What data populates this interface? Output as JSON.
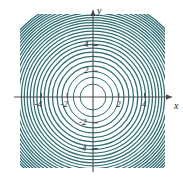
{
  "figure": {
    "name": "concentric-circle-contour-plot",
    "background_color": "#ffffff",
    "contour_color": "#2e6e73",
    "axis_color": "#4a4a4a"
  },
  "axes": {
    "x_label": "x",
    "y_label": "y",
    "x_ticks": [
      {
        "value": -4,
        "label": "-4"
      },
      {
        "value": -2,
        "label": "-2"
      },
      {
        "value": 2,
        "label": "2"
      },
      {
        "value": 4,
        "label": "4"
      }
    ],
    "y_ticks": [
      {
        "value": 4,
        "label": "4"
      },
      {
        "value": 2,
        "label": "2"
      },
      {
        "value": -2,
        "label": "-2"
      },
      {
        "value": -4,
        "label": "-4"
      }
    ]
  },
  "chart_data": {
    "type": "line",
    "title": "",
    "subtitle": "",
    "xlabel": "x",
    "ylabel": "y",
    "xlim": [
      -5.6,
      5.6
    ],
    "ylim": [
      -5.6,
      5.6
    ],
    "grid": false,
    "legend": null,
    "center": [
      0,
      0
    ],
    "series": [
      {
        "name": "concentric-contours",
        "shape": "circle",
        "color": "#2e6e73",
        "radii": [
          1.0,
          1.52,
          1.98,
          2.4,
          2.78,
          3.14,
          3.47,
          3.78,
          4.07,
          4.35,
          4.61,
          4.86,
          5.1,
          5.33,
          5.55,
          5.76,
          5.96,
          6.16,
          6.35,
          6.53,
          6.71,
          6.88,
          7.05,
          7.21,
          7.37,
          7.53,
          7.68
        ]
      }
    ],
    "x_tick_values": [
      -4,
      -2,
      2,
      4
    ],
    "y_tick_values": [
      -4,
      -2,
      2,
      4
    ]
  }
}
